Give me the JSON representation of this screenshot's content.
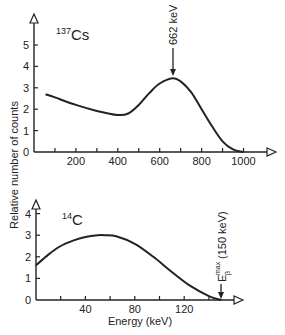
{
  "chart_data": [
    {
      "type": "line",
      "title": "137Cs",
      "title_parts": {
        "mass": "137",
        "element": "Cs"
      },
      "xlabel": "",
      "ylabel": "Relative number of counts",
      "xlim": [
        0,
        1150
      ],
      "ylim": [
        0,
        5.5
      ],
      "x_ticks": [
        100,
        200,
        300,
        400,
        500,
        600,
        700,
        800,
        900,
        1000
      ],
      "x_tick_labels": [
        "200",
        "400",
        "600",
        "800",
        "1000"
      ],
      "x_tick_label_values": [
        200,
        400,
        600,
        800,
        1000
      ],
      "y_ticks": [
        0,
        1,
        2,
        3,
        4,
        5
      ],
      "y_tick_labels": [
        "0",
        "1",
        "2",
        "3",
        "4",
        "5"
      ],
      "grid": false,
      "series": [
        {
          "name": "137Cs spectrum",
          "x": [
            55,
            100,
            200,
            300,
            400,
            450,
            500,
            550,
            600,
            662,
            700,
            750,
            800,
            850,
            900,
            950,
            1000
          ],
          "y": [
            2.7,
            2.55,
            2.2,
            1.92,
            1.73,
            1.8,
            2.2,
            2.75,
            3.2,
            3.45,
            3.3,
            2.8,
            2.0,
            1.2,
            0.5,
            0.12,
            0.0
          ]
        }
      ],
      "annotations": [
        {
          "text": "662 keV",
          "x": 662,
          "arrow_to_y": 3.45,
          "rotated": true
        }
      ]
    },
    {
      "type": "line",
      "title": "14C",
      "title_parts": {
        "mass": "14",
        "element": "C"
      },
      "xlabel": "Energy (keV)",
      "ylabel": "Relative number of counts",
      "xlim": [
        0,
        170
      ],
      "ylim": [
        0,
        4.6
      ],
      "x_ticks": [
        20,
        40,
        60,
        80,
        100,
        120,
        140
      ],
      "x_tick_labels": [
        "40",
        "80",
        "120"
      ],
      "x_tick_label_values": [
        40,
        80,
        120
      ],
      "y_ticks": [
        0,
        1,
        2,
        3,
        4
      ],
      "y_tick_labels": [
        "0",
        "1",
        "2",
        "3",
        "4"
      ],
      "grid": false,
      "series": [
        {
          "name": "14C beta spectrum",
          "x": [
            0,
            10,
            20,
            30,
            40,
            50,
            56,
            65,
            80,
            95,
            110,
            125,
            140,
            150
          ],
          "y": [
            1.6,
            2.1,
            2.5,
            2.75,
            2.92,
            3.0,
            3.0,
            2.95,
            2.6,
            2.0,
            1.3,
            0.65,
            0.18,
            0.0
          ]
        }
      ],
      "annotations": [
        {
          "text": "E",
          "sub": "β",
          "sup": "max",
          "suffix": " (150 keV)",
          "x": 150,
          "arrow_to_y": 0,
          "rotated": true
        }
      ]
    }
  ],
  "labels": {
    "ylabel": "Relative number of counts",
    "xlabel": "Energy (keV)",
    "cs_mass": "137",
    "cs_el": "Cs",
    "c_mass": "14",
    "c_el": "C",
    "cs_peak": "662 keV",
    "c_emax_e": "E",
    "c_emax_sup": "max",
    "c_emax_sub": "β",
    "c_emax_val": "(150 keV)"
  },
  "colors": {
    "line": "#222222",
    "background": "#ffffff"
  }
}
